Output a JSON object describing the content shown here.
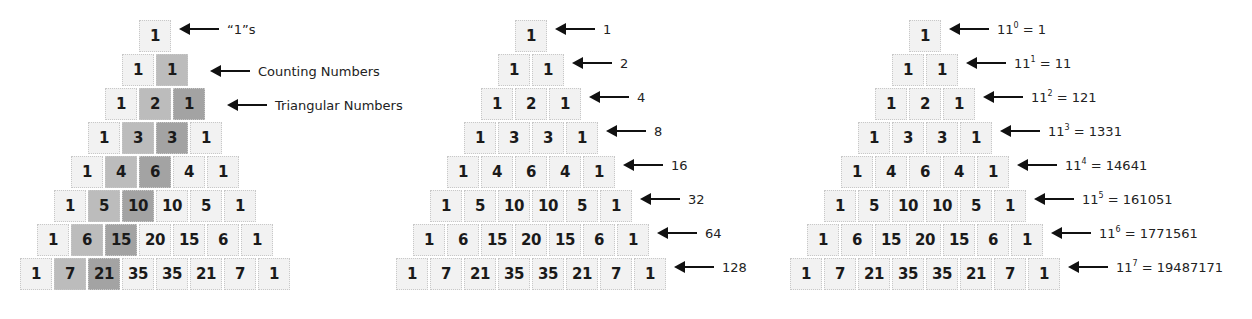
{
  "rows": [
    [
      1
    ],
    [
      1,
      1
    ],
    [
      1,
      2,
      1
    ],
    [
      1,
      3,
      3,
      1
    ],
    [
      1,
      4,
      6,
      4,
      1
    ],
    [
      1,
      5,
      10,
      10,
      5,
      1
    ],
    [
      1,
      6,
      15,
      20,
      15,
      6,
      1
    ],
    [
      1,
      7,
      21,
      35,
      35,
      21,
      7,
      1
    ]
  ],
  "triangles": [
    {
      "name": "shaded-diagonals",
      "top_cell_x": 139,
      "shading": {
        "counting_column_color": "#bcbcbc",
        "triangular_column_color": "#a3a3a3",
        "base_color": "#f2f2f2"
      },
      "annotations": [
        {
          "row": 0,
          "text": "“1”s"
        },
        {
          "row": 1,
          "text": "Counting Numbers"
        },
        {
          "row": 2,
          "text": "Triangular Numbers"
        }
      ]
    },
    {
      "name": "row-sums",
      "top_cell_x": 515,
      "annotations": [
        {
          "row": 0,
          "text": "1"
        },
        {
          "row": 1,
          "text": "2"
        },
        {
          "row": 2,
          "text": "4"
        },
        {
          "row": 3,
          "text": "8"
        },
        {
          "row": 4,
          "text": "16"
        },
        {
          "row": 5,
          "text": "32"
        },
        {
          "row": 6,
          "text": "64"
        },
        {
          "row": 7,
          "text": "128"
        }
      ]
    },
    {
      "name": "powers-of-eleven",
      "top_cell_x": 909,
      "annotations": [
        {
          "row": 0,
          "base": "11",
          "exp": "0",
          "value": "1"
        },
        {
          "row": 1,
          "base": "11",
          "exp": "1",
          "value": "11"
        },
        {
          "row": 2,
          "base": "11",
          "exp": "2",
          "value": "121"
        },
        {
          "row": 3,
          "base": "11",
          "exp": "3",
          "value": "1331"
        },
        {
          "row": 4,
          "base": "11",
          "exp": "4",
          "value": "14641"
        },
        {
          "row": 5,
          "base": "11",
          "exp": "5",
          "value": "161051"
        },
        {
          "row": 6,
          "base": "11",
          "exp": "6",
          "value": "1771561"
        },
        {
          "row": 7,
          "base": "11",
          "exp": "7",
          "value": "19487171"
        }
      ]
    }
  ]
}
